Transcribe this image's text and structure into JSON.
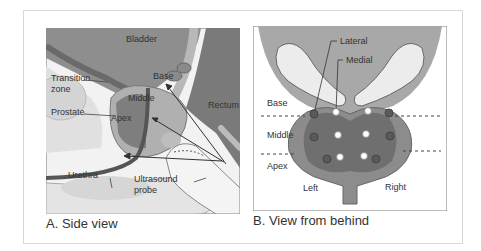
{
  "figure": {
    "panel_a": {
      "caption": "A. Side view",
      "labels": {
        "bladder": "Bladder",
        "transition_zone_1": "Transition",
        "transition_zone_2": "zone",
        "prostate": "Prostate",
        "base": "Base",
        "middle": "Middle",
        "apex": "Apex",
        "rectum": "Rectum",
        "urethra": "Urethra",
        "probe_1": "Ultrasound",
        "probe_2": "probe"
      }
    },
    "panel_b": {
      "caption": "B. View from behind",
      "labels": {
        "lateral": "Lateral",
        "medial": "Medial",
        "base": "Base",
        "middle": "Middle",
        "apex": "Apex",
        "left": "Left",
        "right": "Right"
      },
      "biopsy_sites": {
        "lateral_count": 6,
        "medial_count": 6
      }
    },
    "colors": {
      "frame": "#d8d8d8",
      "gland_dark": "#6f6f6f",
      "gland_mid": "#8c8c8c",
      "bladder_fill": "#9a9a9a",
      "light_tissue": "#e6e6e6",
      "lateral_dot": "#5a5a5a",
      "medial_dot": "#ffffff"
    }
  }
}
